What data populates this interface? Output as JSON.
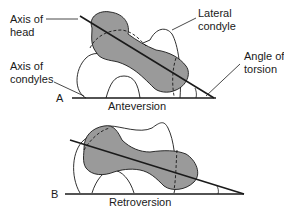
{
  "figure_a": {
    "letter": "A",
    "caption": "Anteversion",
    "labels": {
      "axis_of_head_1": "Axis of",
      "axis_of_head_2": "head",
      "axis_of_condyles_1": "Axis of",
      "axis_of_condyles_2": "condyles",
      "lateral_condyle_1": "Lateral",
      "lateral_condyle_2": "condyle",
      "angle_of_torsion_1": "Angle of",
      "angle_of_torsion_2": "torsion"
    }
  },
  "figure_b": {
    "letter": "B",
    "caption": "Retroversion"
  },
  "colors": {
    "bone_fill": "#9a9a9a",
    "line": "#1a1a1a",
    "background": "#ffffff"
  }
}
